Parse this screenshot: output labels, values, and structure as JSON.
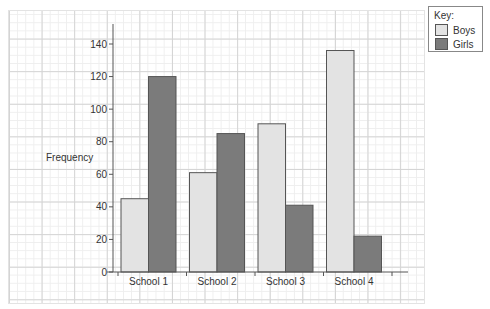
{
  "chart_data": {
    "type": "bar",
    "title": "",
    "xlabel": "",
    "ylabel": "Frequency",
    "ylim": [
      0,
      140
    ],
    "yticks": [
      0,
      20,
      40,
      60,
      80,
      100,
      120,
      140
    ],
    "categories": [
      "School 1",
      "School 2",
      "School 3",
      "School 4"
    ],
    "series": [
      {
        "name": "Boys",
        "values": [
          45,
          61,
          91,
          136
        ],
        "color": "#e3e3e3"
      },
      {
        "name": "Girls",
        "values": [
          120,
          85,
          41,
          22
        ],
        "color": "#7b7b7b"
      }
    ],
    "grid": true,
    "legend_position": "top-right"
  },
  "legend": {
    "title": "Key:",
    "items": [
      {
        "label": "Boys",
        "color": "#e3e3e3"
      },
      {
        "label": "Girls",
        "color": "#7b7b7b"
      }
    ]
  }
}
